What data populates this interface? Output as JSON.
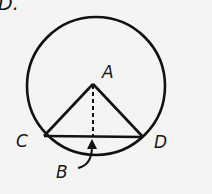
{
  "option_label": "D.",
  "diagram": {
    "circle": {
      "cx": 95,
      "cy": 85,
      "r": 70
    },
    "points": {
      "A": {
        "label": "A",
        "x": 93,
        "y": 84
      },
      "C": {
        "label": "C",
        "x": 44,
        "y": 136
      },
      "D": {
        "label": "D",
        "x": 143,
        "y": 137
      },
      "B": {
        "label": "B",
        "x": 93,
        "y": 137
      }
    },
    "segments": [
      "AC",
      "AD",
      "CD"
    ],
    "dashed_segments": [
      "AB"
    ],
    "arrow": {
      "from": "label-B",
      "to": "B"
    },
    "colors": {
      "stroke": "#111111",
      "background": "#f4f4f2"
    }
  }
}
